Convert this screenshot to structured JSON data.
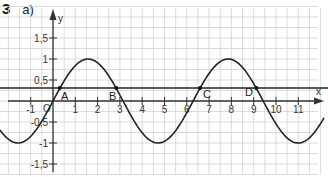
{
  "exercise": {
    "number": "3",
    "part": "a)"
  },
  "axes": {
    "x_label": "x",
    "y_label": "y",
    "origin_label": "O",
    "x_ticks": [
      "-1",
      "1",
      "2",
      "3",
      "4",
      "5",
      "6",
      "7",
      "8",
      "9",
      "10",
      "11"
    ],
    "y_ticks": [
      "1,5",
      "1",
      "0,5",
      "-0,5",
      "-1",
      "-1,5"
    ]
  },
  "points": {
    "A": "A",
    "B": "B",
    "C": "C",
    "D": "D"
  },
  "chart_data": {
    "type": "line",
    "title": "",
    "xlabel": "x",
    "ylabel": "y",
    "xlim": [
      -1.5,
      12
    ],
    "ylim": [
      -1.8,
      1.7
    ],
    "grid": true,
    "series": [
      {
        "name": "y = sin(x)",
        "function": "sin(x)"
      },
      {
        "name": "horizontal line",
        "function": "y = 0.3"
      }
    ],
    "annotations": [
      {
        "label": "A",
        "x": 0.3,
        "y": 0.3
      },
      {
        "label": "B",
        "x": 2.84,
        "y": 0.3
      },
      {
        "label": "C",
        "x": 6.59,
        "y": 0.3
      },
      {
        "label": "D",
        "x": 9.12,
        "y": 0.3
      }
    ]
  },
  "colors": {
    "grid": "#cfcfcf",
    "axis": "#333333",
    "curve": "#222222"
  }
}
